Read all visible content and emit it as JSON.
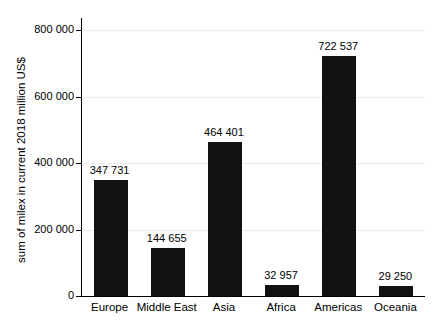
{
  "figure": {
    "background": "#ffffff"
  },
  "chart_data": {
    "type": "bar",
    "categories": [
      "Europe",
      "Middle East",
      "Asia",
      "Africa",
      "Americas",
      "Oceania"
    ],
    "values": [
      347731,
      144655,
      464401,
      32957,
      722537,
      29250
    ],
    "value_labels": [
      "347 731",
      "144 655",
      "464 401",
      "32 957",
      "722 537",
      "29 250"
    ],
    "title": "",
    "xlabel": "",
    "ylabel": "sum of milex in current 2018 million US$",
    "ylim": [
      0,
      800000
    ],
    "yticks": [
      {
        "value": 0,
        "label": "0"
      },
      {
        "value": 200000,
        "label": "200 000"
      },
      {
        "value": 400000,
        "label": "400 000"
      },
      {
        "value": 600000,
        "label": "600 000"
      },
      {
        "value": 800000,
        "label": "800 000"
      }
    ],
    "grid": true,
    "legend": "none",
    "bar_color": "#111111",
    "axis_color": "#000000",
    "grid_color": "#ebebeb",
    "text_color": "#000000"
  }
}
